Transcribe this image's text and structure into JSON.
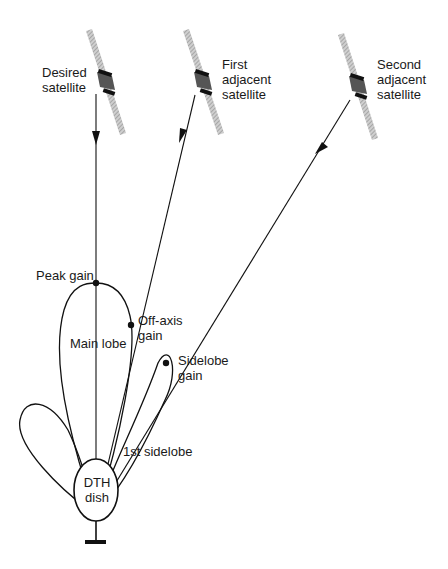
{
  "satellites": [
    {
      "label_line1": "Desired",
      "label_line2": "satellite"
    },
    {
      "label_line1": "First",
      "label_line2": "adjacent",
      "label_line3": "satellite"
    },
    {
      "label_line1": "Second",
      "label_line2": "adjacent",
      "label_line3": "satellite"
    }
  ],
  "pattern_labels": {
    "peak_gain": "Peak gain",
    "off_axis_line1": "Off-axis",
    "off_axis_line2": "gain",
    "main_lobe": "Main lobe",
    "sidelobe_line1": "Sidelobe",
    "sidelobe_line2": "gain",
    "first_sidelobe": "1st sidelobe"
  },
  "dish": {
    "line1": "DTH",
    "line2": "dish"
  }
}
